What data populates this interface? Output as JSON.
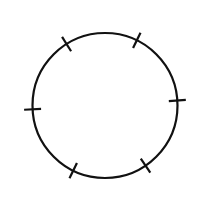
{
  "diagram": {
    "type": "circle-with-radial-ticks",
    "background": "#ffffff",
    "stroke_color": "#111111",
    "stroke_width": 2.2,
    "circle": {
      "cx": 105,
      "cy": 105.5,
      "r": 72.5
    },
    "ticks": {
      "count": 6,
      "length": 17,
      "angles_deg": [
        -122,
        -64,
        -4,
        56,
        116,
        177
      ]
    }
  }
}
